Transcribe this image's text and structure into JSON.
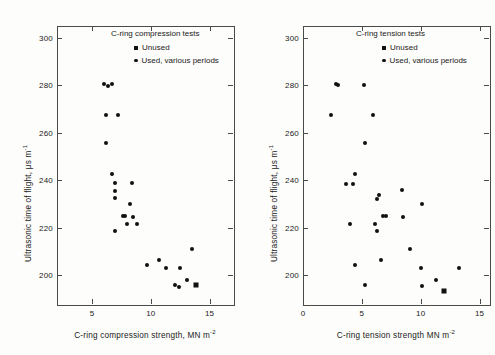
{
  "figure": {
    "background": "#fdfdfb",
    "marker_color": "#111111",
    "axis_color": "#4a4a48"
  },
  "chart_data": [
    {
      "type": "scatter",
      "panel": "left",
      "title": "C-ring compression tests",
      "xlabel": "C-ring compression strength, MN m",
      "xlabel_sup": "-2",
      "ylabel": "Ultrasonic time of flight, μs m",
      "ylabel_sup": "-1",
      "xlim": [
        2.0,
        17.0
      ],
      "ylim": [
        188,
        305
      ],
      "xticks": [
        5,
        10,
        15
      ],
      "yticks": [
        200,
        220,
        240,
        260,
        280,
        300
      ],
      "grid": false,
      "legend_position": "top-right",
      "legend": [
        {
          "label": "Unused",
          "marker": "square"
        },
        {
          "label": "Used, various periods",
          "marker": "circle"
        }
      ],
      "series": [
        {
          "name": "Used, various periods",
          "marker": "circle",
          "points": [
            [
              5.9,
              281.0
            ],
            [
              6.3,
              280.0
            ],
            [
              6.6,
              281.0
            ],
            [
              6.1,
              268.0
            ],
            [
              7.1,
              268.0
            ],
            [
              6.1,
              256.0
            ],
            [
              6.6,
              243.0
            ],
            [
              6.9,
              239.5
            ],
            [
              8.3,
              239.5
            ],
            [
              6.9,
              236.0
            ],
            [
              6.9,
              233.0
            ],
            [
              8.1,
              230.5
            ],
            [
              7.5,
              225.5
            ],
            [
              7.7,
              225.5
            ],
            [
              8.4,
              225.0
            ],
            [
              7.9,
              222.0
            ],
            [
              8.7,
              222.0
            ],
            [
              6.9,
              219.0
            ],
            [
              13.4,
              211.5
            ],
            [
              10.6,
              207.0
            ],
            [
              9.6,
              205.0
            ],
            [
              11.2,
              203.5
            ],
            [
              12.4,
              203.5
            ],
            [
              13.0,
              198.5
            ],
            [
              12.0,
              196.5
            ],
            [
              12.3,
              195.5
            ]
          ]
        },
        {
          "name": "Unused",
          "marker": "square",
          "points": [
            [
              13.8,
              196.5
            ]
          ]
        }
      ]
    },
    {
      "type": "scatter",
      "panel": "right",
      "title": "C-ring tension tests",
      "xlabel": "C-ring tension strength MN m",
      "xlabel_sup": "-2",
      "ylabel": "Ultrasonic time of flight, μs m",
      "ylabel_sup": "-1",
      "xlim": [
        0.0,
        15.8
      ],
      "ylim": [
        188,
        305
      ],
      "xticks": [
        0,
        5,
        10,
        15
      ],
      "yticks": [
        200,
        220,
        240,
        260,
        280,
        300
      ],
      "grid": false,
      "legend_position": "top-right",
      "legend": [
        {
          "label": "Unused",
          "marker": "square"
        },
        {
          "label": "Used, various periods",
          "marker": "circle"
        }
      ],
      "series": [
        {
          "name": "Used, various periods",
          "marker": "circle",
          "points": [
            [
              2.75,
              281.0
            ],
            [
              2.9,
              280.5
            ],
            [
              5.1,
              280.5
            ],
            [
              2.3,
              268.0
            ],
            [
              5.9,
              268.0
            ],
            [
              5.2,
              256.0
            ],
            [
              4.3,
              243.0
            ],
            [
              3.6,
              239.0
            ],
            [
              4.2,
              239.0
            ],
            [
              8.3,
              236.5
            ],
            [
              6.4,
              234.5
            ],
            [
              6.2,
              232.5
            ],
            [
              10.0,
              230.5
            ],
            [
              6.7,
              225.5
            ],
            [
              7.0,
              225.5
            ],
            [
              8.4,
              225.0
            ],
            [
              3.9,
              222.0
            ],
            [
              6.0,
              222.0
            ],
            [
              6.2,
              219.0
            ],
            [
              9.0,
              211.5
            ],
            [
              6.5,
              207.0
            ],
            [
              4.3,
              205.0
            ],
            [
              9.9,
              203.5
            ],
            [
              13.2,
              203.5
            ],
            [
              11.2,
              198.5
            ],
            [
              5.2,
              196.5
            ],
            [
              10.0,
              196.0
            ]
          ]
        },
        {
          "name": "Unused",
          "marker": "square",
          "points": [
            [
              11.9,
              194.0
            ]
          ]
        }
      ]
    }
  ]
}
